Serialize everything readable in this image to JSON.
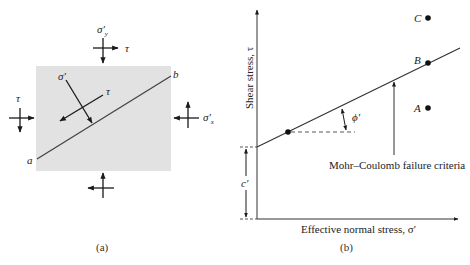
{
  "panel_a": {
    "caption": "(a)",
    "element_fill": "#e2e2e2",
    "plane_start_label": "a",
    "plane_end_label": "b",
    "top_normal_label": "σ′y",
    "top_normal_symbol": "σ′",
    "top_normal_subscript": "y",
    "top_shear_label": "τ",
    "left_shear_label": "τ",
    "right_normal_symbol": "σ′",
    "right_normal_subscript": "x",
    "inner_normal_label": "σ′",
    "inner_shear_label": "τ"
  },
  "panel_b": {
    "caption": "(b)",
    "y_axis_label": "Shear stress, τ",
    "x_axis_label": "Effective normal stress, σ′",
    "failure_line_label": "Mohr–Coulomb failure criteria",
    "friction_angle_label": "ϕ′",
    "cohesion_label": "c′",
    "points": [
      {
        "label": "C",
        "position": "above envelope"
      },
      {
        "label": "B",
        "position": "on envelope"
      },
      {
        "label": "A",
        "position": "below envelope"
      }
    ]
  },
  "colors": {
    "line": "#222222",
    "dashed": "#333333",
    "text": "#222222"
  }
}
